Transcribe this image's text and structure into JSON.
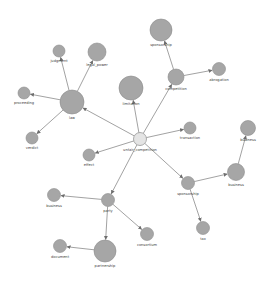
{
  "graph": {
    "type": "directed-network",
    "colors": {
      "node": "#a6a6a6",
      "hub": "#e4e4e4",
      "edge": "#8a8a8a",
      "label": "#444444"
    },
    "nodes": [
      {
        "id": "unfair_competition",
        "label": "unfair_competition",
        "hub": true,
        "weight": 1
      },
      {
        "id": "law",
        "label": "law",
        "weight": 3
      },
      {
        "id": "judgment",
        "label": "judgment",
        "weight": 1
      },
      {
        "id": "legal_power",
        "label": "legal_power",
        "weight": 2
      },
      {
        "id": "proceeding",
        "label": "proceeding",
        "weight": 1
      },
      {
        "id": "verdict",
        "label": "verdict",
        "weight": 1
      },
      {
        "id": "limitation",
        "label": "limitation",
        "weight": 3
      },
      {
        "id": "competition",
        "label": "competition",
        "weight": 2
      },
      {
        "id": "sponsorship_top",
        "label": "sponsorship",
        "weight": 3
      },
      {
        "id": "abrogation",
        "label": "abrogation",
        "weight": 1
      },
      {
        "id": "transaction",
        "label": "transaction",
        "weight": 1
      },
      {
        "id": "effect",
        "label": "effect",
        "weight": 1
      },
      {
        "id": "party",
        "label": "party",
        "weight": 1
      },
      {
        "id": "business_left",
        "label": "business",
        "weight": 1
      },
      {
        "id": "partnership",
        "label": "partnership",
        "weight": 3
      },
      {
        "id": "document",
        "label": "document",
        "weight": 1
      },
      {
        "id": "consortium",
        "label": "consortium",
        "weight": 1
      },
      {
        "id": "sponsorship_low",
        "label": "sponsorship",
        "weight": 1
      },
      {
        "id": "business_right",
        "label": "business",
        "weight": 2
      },
      {
        "id": "business_top",
        "label": "business",
        "weight": 1.5
      },
      {
        "id": "tax",
        "label": "tax",
        "weight": 1
      }
    ],
    "edges": [
      {
        "from": "unfair_competition",
        "to": "law"
      },
      {
        "from": "law",
        "to": "judgment"
      },
      {
        "from": "law",
        "to": "legal_power"
      },
      {
        "from": "law",
        "to": "proceeding"
      },
      {
        "from": "law",
        "to": "verdict"
      },
      {
        "from": "unfair_competition",
        "to": "competition"
      },
      {
        "from": "competition",
        "to": "sponsorship_top"
      },
      {
        "from": "competition",
        "to": "abrogation"
      },
      {
        "from": "unfair_competition",
        "to": "transaction"
      },
      {
        "from": "unfair_competition",
        "to": "effect"
      },
      {
        "from": "unfair_competition",
        "to": "party"
      },
      {
        "from": "party",
        "to": "business_left"
      },
      {
        "from": "party",
        "to": "partnership"
      },
      {
        "from": "party",
        "to": "consortium"
      },
      {
        "from": "partnership",
        "to": "document"
      },
      {
        "from": "unfair_competition",
        "to": "sponsorship_low"
      },
      {
        "from": "sponsorship_low",
        "to": "business_right"
      },
      {
        "from": "sponsorship_low",
        "to": "tax"
      },
      {
        "from": "business_right",
        "to": "business_top"
      },
      {
        "from": "unfair_competition",
        "to": "limitation"
      }
    ]
  }
}
